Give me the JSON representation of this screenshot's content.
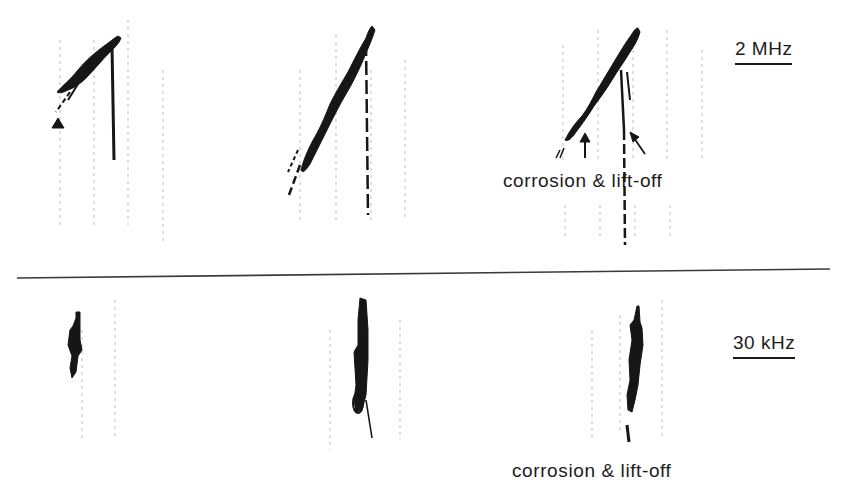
{
  "figure": {
    "type": "eddy-current impedance-plane traces",
    "rows": [
      {
        "frequency_label": "2 MHz",
        "panels": [
          {
            "id": "signal-1",
            "annotation": ""
          },
          {
            "id": "signal-2",
            "annotation": ""
          },
          {
            "id": "signal-3",
            "annotation": "corrosion & lift-off",
            "arrows": [
              "corrosion-arrow",
              "lift-off-arrow"
            ]
          }
        ]
      },
      {
        "frequency_label": "30 kHz",
        "panels": [
          {
            "id": "signal-1",
            "annotation": ""
          },
          {
            "id": "signal-2",
            "annotation": ""
          },
          {
            "id": "signal-3",
            "annotation": "corrosion & lift-off"
          }
        ]
      }
    ],
    "colors": {
      "ink": "#1a1a1a",
      "grid": "#b8b8b8",
      "background": "#ffffff"
    }
  },
  "labels": {
    "top_frequency": "2 MHz",
    "bottom_frequency": "30 kHz",
    "top_annotation": "corrosion & lift-off",
    "bottom_annotation": "corrosion & lift-off"
  }
}
